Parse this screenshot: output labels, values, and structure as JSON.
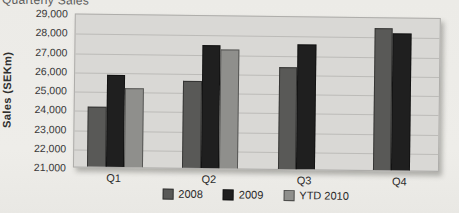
{
  "page": {
    "background": "#eeede9"
  },
  "chart_data": {
    "type": "bar",
    "title": "Quarterly Sales",
    "ylabel": "Sales (SEKm)",
    "xlabel": "",
    "categories": [
      "Q1",
      "Q2",
      "Q3",
      "Q4"
    ],
    "series": [
      {
        "name": "2008",
        "color": "#595957",
        "values": [
          24100,
          25500,
          26300,
          28400
        ]
      },
      {
        "name": "2009",
        "color": "#1f1f1f",
        "values": [
          25800,
          27400,
          27500,
          28100
        ]
      },
      {
        "name": "YTD 2010",
        "color": "#8f8f8c",
        "values": [
          25100,
          27200,
          null,
          null
        ]
      }
    ],
    "ylim": [
      21000,
      29000
    ],
    "ytick_step": 1000,
    "ytick_labels": [
      "29,000",
      "28,000",
      "27,000",
      "26,000",
      "25,000",
      "24,000",
      "23,000",
      "22,000",
      "21,000"
    ],
    "grid": true,
    "legend_position": "bottom"
  }
}
